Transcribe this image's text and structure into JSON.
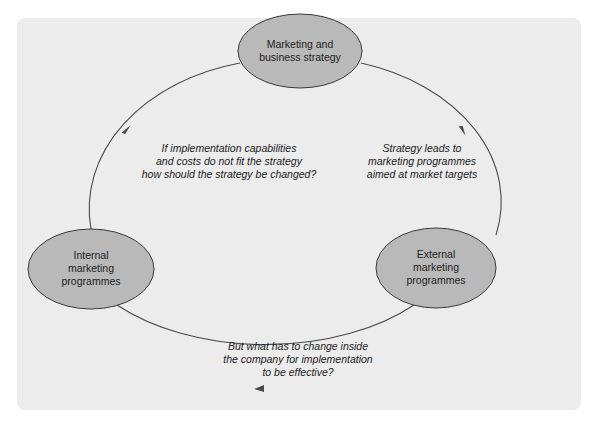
{
  "diagram": {
    "type": "cycle",
    "colors": {
      "panel_bg": "#ececec",
      "node_fill": "#b9b9b9",
      "node_stroke": "#3a3a3a",
      "edge_stroke": "#4a4a4a",
      "text": "#222222"
    },
    "nodes": [
      {
        "id": "strategy",
        "label_lines": [
          "Marketing and",
          "business strategy"
        ]
      },
      {
        "id": "external",
        "label_lines": [
          "External",
          "marketing",
          "programmes"
        ]
      },
      {
        "id": "internal",
        "label_lines": [
          "Internal",
          "marketing",
          "programmes"
        ]
      }
    ],
    "edges": [
      {
        "from": "strategy",
        "to": "external",
        "annotation_lines": [
          "Strategy leads to",
          "marketing programmes",
          "aimed at market targets"
        ]
      },
      {
        "from": "external",
        "to": "internal",
        "annotation_lines": [
          "But what has to change inside",
          "the company for implementation",
          "to be effective?"
        ]
      },
      {
        "from": "internal",
        "to": "strategy",
        "annotation_lines": [
          "If implementation capabilities",
          "and costs do not fit the strategy",
          "how should the strategy be changed?"
        ]
      }
    ]
  }
}
